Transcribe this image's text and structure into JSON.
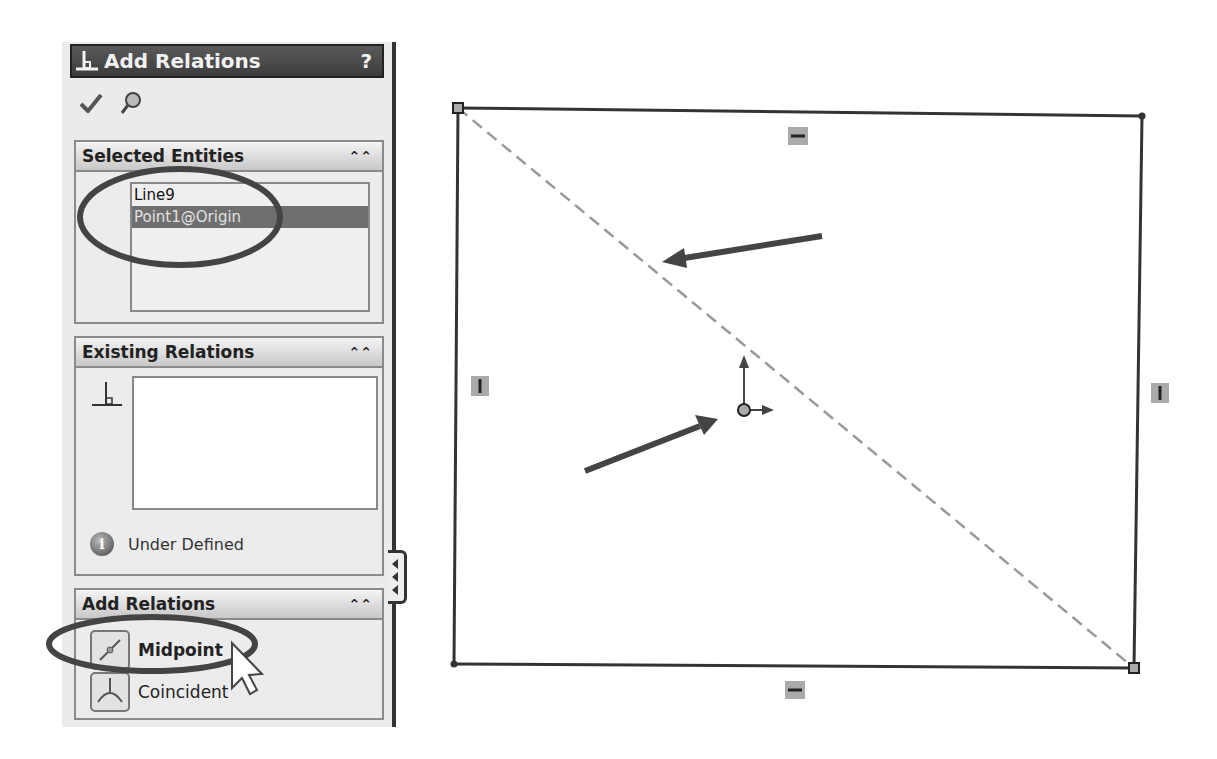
{
  "property_manager": {
    "title": "Add Relations",
    "help_label": "?",
    "toolbar": {
      "ok_icon": "checkmark-icon",
      "pin_icon": "pushpin-icon"
    },
    "groups": {
      "selected_entities": {
        "header": "Selected Entities",
        "collapse_icon": "double-chevron-up-icon",
        "items": [
          {
            "label": "Line9",
            "selected": false
          },
          {
            "label": "Point1@Origin",
            "selected": true
          }
        ]
      },
      "existing_relations": {
        "header": "Existing Relations",
        "collapse_icon": "double-chevron-up-icon",
        "items": [],
        "status_label": "Under Defined",
        "status_icon": "info-icon"
      },
      "add_relations": {
        "header": "Add Relations",
        "collapse_icon": "double-chevron-up-icon",
        "options": [
          {
            "label": "Midpoint",
            "icon": "midpoint-icon",
            "bold": true
          },
          {
            "label": "Coincident",
            "icon": "coincident-icon",
            "bold": false
          }
        ]
      }
    },
    "flyout_icon": "expand-flyout-icon"
  },
  "sketch": {
    "rectangle": {
      "corners": [
        [
          458,
          108
        ],
        [
          1142,
          116
        ],
        [
          1134,
          668
        ],
        [
          454,
          664
        ]
      ]
    },
    "diagonal_line": {
      "name": "Line9",
      "style": "dashed",
      "from": [
        458,
        108
      ],
      "to": [
        1134,
        668
      ]
    },
    "origin": {
      "name": "Point1@Origin",
      "position": [
        744,
        410
      ]
    },
    "relation_badges": [
      {
        "type": "horizontal",
        "position": [
          798,
          136
        ]
      },
      {
        "type": "horizontal",
        "position": [
          795,
          690
        ]
      },
      {
        "type": "vertical",
        "position": [
          480,
          386
        ]
      },
      {
        "type": "vertical",
        "position": [
          1160,
          393
        ]
      }
    ],
    "annotation_arrows": [
      {
        "target": "diagonal_line",
        "from": [
          822,
          236
        ],
        "to": [
          664,
          262
        ]
      },
      {
        "target": "origin",
        "from": [
          585,
          470
        ],
        "to": [
          716,
          420
        ]
      }
    ],
    "highlight_ellipses": [
      {
        "target": "selected_entities",
        "cx": 180,
        "cy": 217,
        "rx": 100,
        "ry": 48
      },
      {
        "target": "midpoint_option",
        "cx": 152,
        "cy": 644,
        "rx": 103,
        "ry": 27
      }
    ]
  }
}
